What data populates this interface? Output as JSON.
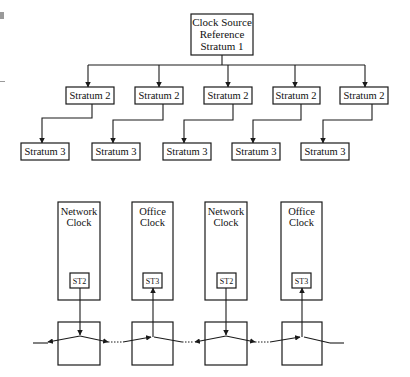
{
  "hierarchy": {
    "root": {
      "lines": [
        "Clock Source",
        "Reference",
        "Stratum 1"
      ]
    },
    "stratum2": [
      "Stratum 2",
      "Stratum 2",
      "Stratum 2",
      "Stratum 2",
      "Stratum 2"
    ],
    "stratum3": [
      "Stratum 3",
      "Stratum 3",
      "Stratum 3",
      "Stratum 3",
      "Stratum 3"
    ]
  },
  "network": {
    "clocks": [
      {
        "line1": "Network",
        "line2": "Clock",
        "unit": "ST2",
        "direction": "down"
      },
      {
        "line1": "Office",
        "line2": "Clock",
        "unit": "ST3",
        "direction": "up"
      },
      {
        "line1": "Network",
        "line2": "Clock",
        "unit": "ST2",
        "direction": "down"
      },
      {
        "line1": "Office",
        "line2": "Clock",
        "unit": "ST3",
        "direction": "up"
      }
    ]
  },
  "colors": {
    "stroke": "#1a1a1a",
    "background": "#ffffff",
    "text": "#111111"
  }
}
